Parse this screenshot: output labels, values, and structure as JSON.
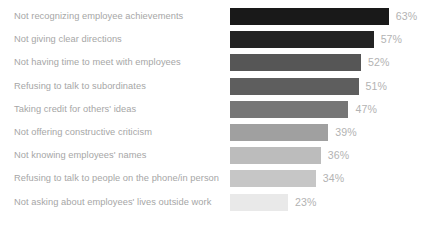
{
  "chart_data": {
    "type": "bar",
    "orientation": "horizontal",
    "title": "",
    "subtitle": "",
    "xlabel": "",
    "ylabel": "",
    "grid": false,
    "legend": false,
    "legend_position": "none",
    "xlim": [
      0,
      63
    ],
    "value_suffix": "%",
    "categories": [
      "Not recognizing employee achievements",
      "Not giving clear directions",
      "Not having time to meet with employees",
      "Refusing to talk to subordinates",
      "Taking credit for others' ideas",
      "Not offering constructive criticism",
      "Not knowing employees' names",
      "Refusing to talk to people on the phone/in person",
      "Not asking about employees' lives outside work"
    ],
    "values": [
      63,
      57,
      52,
      51,
      47,
      39,
      36,
      34,
      23
    ],
    "value_labels": [
      "63%",
      "57%",
      "52%",
      "51%",
      "47%",
      "39%",
      "36%",
      "34%",
      "23%"
    ],
    "bar_colors": [
      "#191919",
      "#232323",
      "#565656",
      "#5e5e5e",
      "#767676",
      "#a0a0a0",
      "#bcbcbc",
      "#c6c6c6",
      "#e9e9e9"
    ]
  },
  "style": {
    "background": "#ffffff",
    "label_color": "#a6a6a6",
    "value_color": "#b3b3b3"
  }
}
